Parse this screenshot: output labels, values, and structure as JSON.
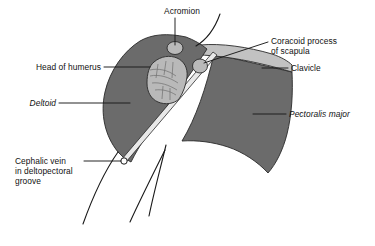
{
  "figure": {
    "type": "anatomical-illustration",
    "background_color": "#ffffff",
    "palette": {
      "muscle_fill": "#6b6b6b",
      "bone_fill": "#b9b9b9",
      "clavicle_fill": "#c2c2c2",
      "groove_fill": "#e8e8e8",
      "outline": "#1a1a1a",
      "text": "#111111"
    }
  },
  "labels": {
    "acromion": {
      "text": "Acromion",
      "style": "normal",
      "position": "top-center"
    },
    "coracoid_process": {
      "line1": "Coracoid process",
      "line2": "of scapula",
      "style": "normal",
      "position": "right-upper"
    },
    "clavicle": {
      "text": "Clavicle",
      "style": "normal",
      "position": "right-middle"
    },
    "pectoralis_major": {
      "text": "Pectoralis major",
      "style": "italic",
      "position": "right-lower"
    },
    "head_of_humerus": {
      "text": "Head of humerus",
      "style": "normal",
      "position": "left-upper"
    },
    "deltoid": {
      "text": "Deltoid",
      "style": "italic",
      "position": "left-middle"
    },
    "cephalic_vein": {
      "line1": "Cephalic vein",
      "line2": "in deltopectoral",
      "line3": "groove",
      "style": "normal",
      "position": "left-lower"
    }
  },
  "structures": [
    {
      "name": "deltoid-muscle",
      "kind": "muscle",
      "shade": "#6b6b6b"
    },
    {
      "name": "pectoralis-major-muscle",
      "kind": "muscle",
      "shade": "#6b6b6b"
    },
    {
      "name": "clavicle-bone",
      "kind": "bone",
      "shade": "#c2c2c2"
    },
    {
      "name": "head-of-humerus-bone",
      "kind": "bone",
      "shade": "#b9b9b9"
    },
    {
      "name": "acromion-bone",
      "kind": "bone",
      "shade": "#b9b9b9"
    },
    {
      "name": "coracoid-process-bone",
      "kind": "bone",
      "shade": "#b9b9b9"
    },
    {
      "name": "deltopectoral-groove",
      "kind": "groove",
      "shade": "#e8e8e8"
    },
    {
      "name": "cephalic-vein-marker",
      "kind": "vessel",
      "shade": "#ffffff"
    }
  ]
}
